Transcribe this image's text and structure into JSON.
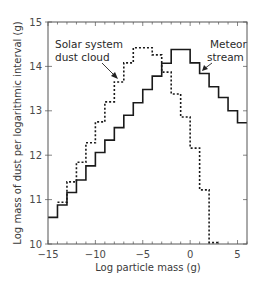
{
  "chart_data": {
    "type": "line",
    "subtype": "step",
    "title": "",
    "xlabel": "Log particle mass (g)",
    "ylabel": "Log mass of dust per logarithmic interval (g)",
    "xlim": [
      -15,
      6
    ],
    "ylim": [
      10,
      15
    ],
    "x_ticks": [
      -15,
      -10,
      -5,
      0,
      5
    ],
    "x_tick_labels": [
      "−15",
      "−10",
      "−5",
      "0",
      "5"
    ],
    "y_ticks": [
      10,
      11,
      12,
      13,
      14,
      15
    ],
    "y_tick_labels": [
      "10",
      "11",
      "12",
      "13",
      "14",
      "15"
    ],
    "grid": false,
    "legend": null,
    "series": [
      {
        "name": "Solar system dust cloud",
        "style": "dotted",
        "bin_edges": [
          -14,
          -13,
          -12,
          -11,
          -10,
          -9,
          -8,
          -7,
          -6,
          -4,
          -3,
          -2,
          -1,
          0,
          1,
          2,
          3
        ],
        "values": [
          10.94,
          11.4,
          11.84,
          12.28,
          12.75,
          13.2,
          13.65,
          14.08,
          14.42,
          14.26,
          13.87,
          13.38,
          12.86,
          12.16,
          11.22,
          10.03
        ]
      },
      {
        "name": "Meteor stream",
        "style": "solid",
        "bin_edges": [
          -15,
          -14,
          -13,
          -12,
          -11,
          -10,
          -9,
          -8,
          -7,
          -6,
          -5,
          -4,
          -3,
          -2,
          0,
          1,
          2,
          3,
          4,
          5,
          6
        ],
        "values": [
          10.6,
          10.88,
          11.16,
          11.44,
          11.76,
          12.06,
          12.34,
          12.62,
          12.9,
          13.18,
          13.48,
          13.78,
          14.07,
          14.38,
          14.08,
          13.84,
          13.54,
          13.3,
          13.0,
          12.73
        ]
      }
    ],
    "annotations": [
      {
        "text_lines": [
          "Solar system",
          "dust cloud"
        ],
        "points_to": "Solar system dust cloud"
      },
      {
        "text_lines": [
          "Meteor",
          "stream"
        ],
        "points_to": "Meteor stream"
      }
    ]
  }
}
